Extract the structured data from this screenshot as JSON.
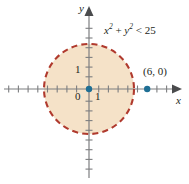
{
  "figure": {
    "background_color": "#ffffff"
  },
  "axes": {
    "x_label": "x",
    "y_label": "y",
    "axis_color": "#7d7e80",
    "origin_px": {
      "x": 89,
      "y": 89
    },
    "unit_px": 9.7,
    "x_range": [
      -9,
      9
    ],
    "y_range": [
      -9,
      9
    ],
    "tick_labels": {
      "origin": "0",
      "x_one": "1",
      "y_one": "1"
    }
  },
  "region": {
    "inequality": {
      "lhs_var1": "x",
      "lhs_exp1": "2",
      "plus": "+",
      "lhs_var2": "y",
      "lhs_exp2": "2",
      "relation": "<",
      "rhs": "25",
      "full_text": "x² + y² < 25"
    },
    "boundary_style": "dashed",
    "boundary_color": "#b03a2e",
    "fill_color": "#f5e2c8",
    "center": [
      0,
      0
    ],
    "radius": 5
  },
  "points": [
    {
      "name": "origin-point",
      "label": "",
      "coords": [
        0,
        0
      ],
      "color": "#1f6f94"
    },
    {
      "name": "point-6-0",
      "label": "(6, 0)",
      "coords": [
        6,
        0
      ],
      "color": "#1f6f94"
    }
  ],
  "colors": {
    "boundary": "#b03a2e",
    "fill": "#f5e2c8",
    "point": "#1f6f94",
    "axis": "#7d7e80",
    "text": "#231f20"
  }
}
